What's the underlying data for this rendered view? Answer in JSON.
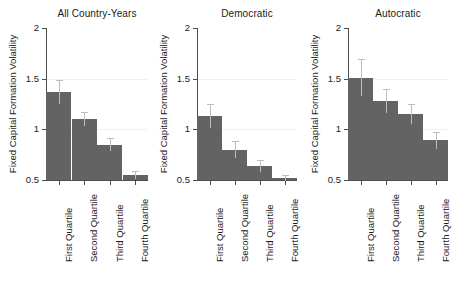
{
  "figure": {
    "width": 449,
    "height": 286,
    "background": "#ffffff",
    "bar_color": "#636363",
    "error_bar_color": "#bdbdbd",
    "axis_color": "#4d4d4d",
    "grid_color": "#f0f0f0"
  },
  "chart_data": {
    "type": "bar",
    "title": "",
    "xlabel": "",
    "ylabel": "Fixed Capital Formation Volatility",
    "ylim": [
      0.5,
      2
    ],
    "yticks": [
      0.5,
      1,
      1.5,
      2
    ],
    "ytick_labels": [
      "0.5",
      "1",
      "1.5",
      "2"
    ],
    "grid": false,
    "legend": "none",
    "categories": [
      "First Quartile",
      "Second Quartile",
      "Third Quartile",
      "Fourth Quartile"
    ],
    "panels": [
      {
        "title": "All Country-Years",
        "values": [
          1.37,
          1.1,
          0.85,
          0.55
        ],
        "error_upper": [
          1.49,
          1.17,
          0.91,
          0.59
        ],
        "error_lower": [
          1.25,
          1.03,
          0.79,
          0.51
        ]
      },
      {
        "title": "Democratic",
        "values": [
          1.13,
          0.8,
          0.64,
          0.52
        ],
        "error_upper": [
          1.25,
          0.88,
          0.7,
          0.55
        ],
        "error_lower": [
          1.01,
          0.72,
          0.58,
          0.49
        ]
      },
      {
        "title": "Autocratic",
        "values": [
          1.51,
          1.28,
          1.15,
          0.89
        ],
        "error_upper": [
          1.69,
          1.4,
          1.25,
          0.97
        ],
        "error_lower": [
          1.33,
          1.16,
          1.05,
          0.81
        ]
      }
    ]
  }
}
